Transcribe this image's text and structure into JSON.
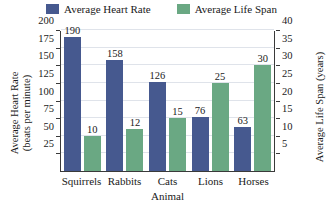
{
  "chart_data": {
    "type": "bar",
    "title": "",
    "categories": [
      "Squirrels",
      "Rabbits",
      "Cats",
      "Lions",
      "Horses"
    ],
    "series": [
      {
        "name": "Average Heart Rate",
        "values": [
          190,
          158,
          126,
          76,
          63
        ],
        "color": "#46598f",
        "axis": "left"
      },
      {
        "name": "Average Life Span",
        "values": [
          10,
          12,
          15,
          25,
          30
        ],
        "color": "#6aa883",
        "axis": "right"
      }
    ],
    "xlabel": "Animal",
    "ylabel_left_line1": "Average Heart Rate",
    "ylabel_left_line2": "(beats per minute)",
    "ylabel_right": "Average Life Span (years)",
    "ylim_left": [
      0,
      200
    ],
    "ylim_right": [
      0,
      40
    ],
    "yticks_left": [
      25,
      50,
      75,
      100,
      125,
      150,
      175,
      200
    ],
    "yticks_right": [
      5,
      10,
      15,
      20,
      25,
      30,
      35,
      40
    ],
    "grid": true,
    "legend_position": "top",
    "axis_color": "#3a3a3a",
    "grid_color": "#dfe3ea",
    "background": "#ffffff"
  }
}
